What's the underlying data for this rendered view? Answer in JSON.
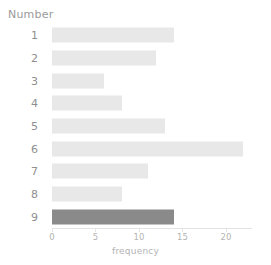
{
  "chart_data": {
    "type": "bar",
    "orientation": "horizontal",
    "title": "",
    "xlabel": "frequency",
    "ylabel": "Number",
    "categories": [
      "1",
      "2",
      "3",
      "4",
      "5",
      "6",
      "7",
      "8",
      "9"
    ],
    "values": [
      14,
      12,
      6,
      8,
      13,
      22,
      11,
      8,
      14
    ],
    "series": [
      {
        "name": "frequency",
        "values": [
          14,
          12,
          6,
          8,
          13,
          22,
          11,
          8,
          14
        ]
      }
    ],
    "xlim": [
      0,
      23
    ],
    "xticks": [
      0,
      5,
      10,
      15,
      20
    ],
    "xtick_labels": [
      "0",
      "5",
      "10",
      "15",
      "20"
    ],
    "grid": false,
    "legend": "none",
    "highlighted_category": "9",
    "bar_color": "#e8e8e8",
    "highlight_color": "#8a8a8a",
    "axis_color": "#e3e3e3",
    "tick_label_color": "#b4b4b4",
    "category_label_color": "#8f8f8f",
    "axis_title_color": "#9a9a9a",
    "background": "#ffffff"
  }
}
